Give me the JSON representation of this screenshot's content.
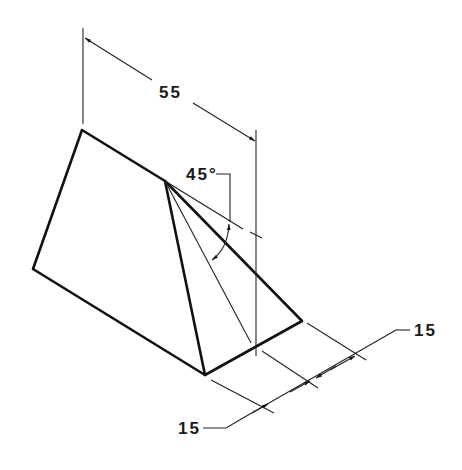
{
  "drawing": {
    "type": "isometric technical drawing of a triangular prism (wedge)",
    "dimensions": {
      "length_label": "55",
      "angle_label": "45°",
      "right_offset_label": "15",
      "bottom_offset_label": "15"
    },
    "colors": {
      "background": "#ffffff",
      "line": "#111111"
    }
  }
}
